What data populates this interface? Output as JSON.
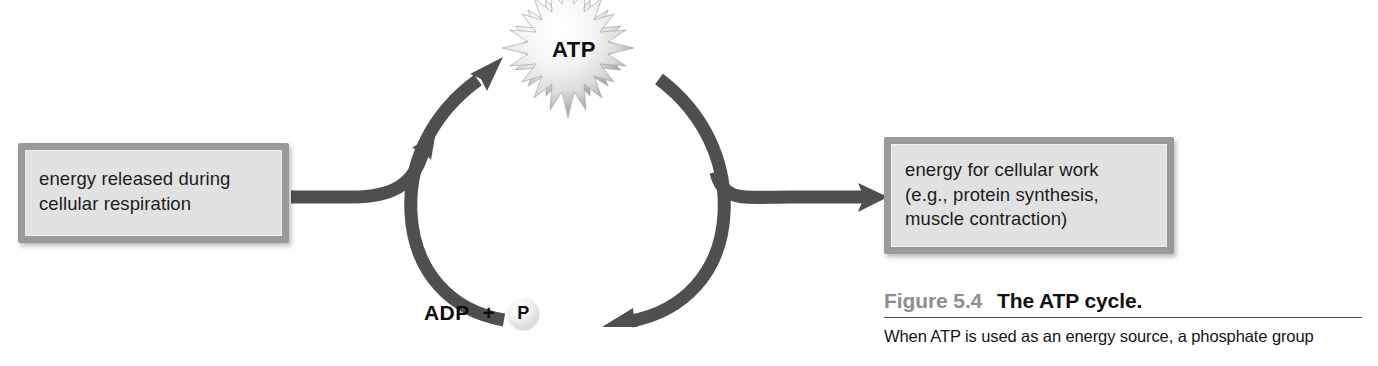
{
  "figure": {
    "atp_label": "ATP",
    "source_box_text": "energy released during\ncellular respiration",
    "target_box_text": "energy for cellular work\n(e.g., protein synthesis,\nmuscle contraction)",
    "adp_label": "ADP",
    "plus_sign": "+",
    "phosphate_label": "P"
  },
  "caption": {
    "figure_number": "Figure 5.4",
    "figure_title": "The ATP cycle.",
    "body_text": "When ATP is used as an energy source, a phosphate group"
  },
  "colors": {
    "arrow_gray": "#4f4f4f",
    "box_fill": "#e2e2e2",
    "box_border": "#9a9a9a",
    "burst_edge": "#9e9e9e",
    "figure_number_gray": "#8d8d8d",
    "text_black": "#111111",
    "page_background": "#ffffff"
  },
  "icons": {
    "atp_burst": "starburst-icon",
    "phosphate": "phosphate-sphere-icon",
    "cycle_arrow_up": "curved-arrow-up-icon",
    "cycle_arrow_down": "curved-arrow-down-icon",
    "input_arrow": "arrow-right-icon",
    "output_arrow": "arrow-right-icon"
  }
}
